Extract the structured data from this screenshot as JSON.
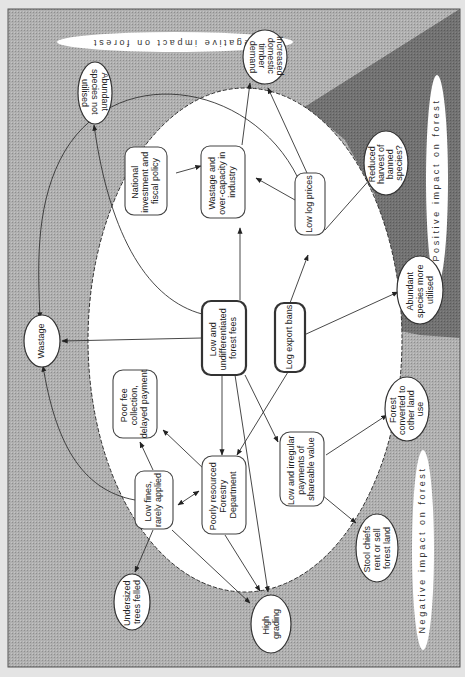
{
  "diagram": {
    "orientation": "rotated 90 degrees clockwise (text reads bottom-to-top)",
    "colors": {
      "page_background": "#e4e4e4",
      "negative_zone": "#a9a9a9",
      "positive_zone": "#6f6f6f",
      "center_ellipse": "#ffffff",
      "stroke": "#333333"
    },
    "zones": {
      "negative_top": "Negative impact on forest",
      "positive": "Positive impact on forest",
      "negative_bottom": "Negative impact on forest"
    },
    "core_nodes": {
      "forest_fees": [
        "Low and",
        "undifferentiated",
        "forest fees"
      ],
      "log_export_bans": [
        "Log export bans"
      ],
      "low_log_prices": [
        "Low log prices"
      ],
      "wastage_industry": [
        "Wastage and",
        "over-capacity in",
        "industry"
      ],
      "national_policy": [
        "National",
        "investment and",
        "fiscal policy"
      ],
      "poor_fee_collection": [
        "Poor fee",
        "collection,",
        "delayed payment"
      ],
      "low_fines": [
        "Low fines,",
        "rarely applied"
      ],
      "forestry_department": [
        "Poorly resourced",
        "Forestry",
        "Department"
      ],
      "irregular_payments": [
        "Low and irregular",
        "payments of",
        "shareable value"
      ]
    },
    "outcome_nodes": {
      "abundant_not_utilised": [
        "Abundant",
        "species not",
        "utilised"
      ],
      "domestic_demand": [
        "Increased",
        "domestic",
        "timber",
        "demand"
      ],
      "reduced_harvest": [
        "Reduced",
        "harvest of",
        "banned",
        "species?"
      ],
      "abundant_more_utilised": [
        "Abundant",
        "species more",
        "utilised"
      ],
      "forest_converted": [
        "Forest",
        "converted to",
        "other land",
        "use"
      ],
      "stool_chiefs": [
        "Stool chiefs",
        "rent or sell",
        "forest land"
      ],
      "high_grading": [
        "High",
        "grading"
      ],
      "undersized_trees": [
        "Undersized",
        "trees felled"
      ],
      "wastage": [
        "Wastage"
      ]
    },
    "edges": [
      {
        "from": "Low and undifferentiated forest fees",
        "to": "Wastage and over-capacity in industry"
      },
      {
        "from": "Low and undifferentiated forest fees",
        "to": "Wastage"
      },
      {
        "from": "Low and undifferentiated forest fees",
        "to": "Abundant species not utilised"
      },
      {
        "from": "Low and undifferentiated forest fees",
        "to": "Poorly resourced Forestry Department"
      },
      {
        "from": "Low and undifferentiated forest fees",
        "to": "Low and irregular payments of shareable value"
      },
      {
        "from": "Low and undifferentiated forest fees",
        "to": "High grading"
      },
      {
        "from": "Log export bans",
        "to": "Low log prices"
      },
      {
        "from": "Log export bans",
        "to": "Abundant species more utilised"
      },
      {
        "from": "Log export bans",
        "to": "Poorly resourced Forestry Department"
      },
      {
        "from": "Low log prices",
        "to": "Wastage and over-capacity in industry"
      },
      {
        "from": "Low log prices",
        "to": "Increased domestic timber demand"
      },
      {
        "from": "Low log prices",
        "to": "Reduced harvest of banned species?"
      },
      {
        "from": "Low log prices",
        "to": "Wastage"
      },
      {
        "from": "Wastage and over-capacity in industry",
        "to": "Increased domestic timber demand"
      },
      {
        "from": "National investment and fiscal policy",
        "to": "Wastage and over-capacity in industry"
      },
      {
        "from": "Poorly resourced Forestry Department",
        "to": "Poor fee collection, delayed payment"
      },
      {
        "from": "Poorly resourced Forestry Department",
        "to": "Low fines, rarely applied",
        "bidirectional": true
      },
      {
        "from": "Poorly resourced Forestry Department",
        "to": "High grading"
      },
      {
        "from": "Low fines, rarely applied",
        "to": "Poor fee collection, delayed payment"
      },
      {
        "from": "Low fines, rarely applied",
        "to": "Undersized trees felled"
      },
      {
        "from": "Low fines, rarely applied",
        "to": "High grading"
      },
      {
        "from": "Low fines, rarely applied",
        "to": "Wastage"
      },
      {
        "from": "Low and irregular payments of shareable value",
        "to": "Stool chiefs rent or sell forest land"
      },
      {
        "from": "Low and irregular payments of shareable value",
        "to": "Forest converted to other land use"
      }
    ]
  }
}
